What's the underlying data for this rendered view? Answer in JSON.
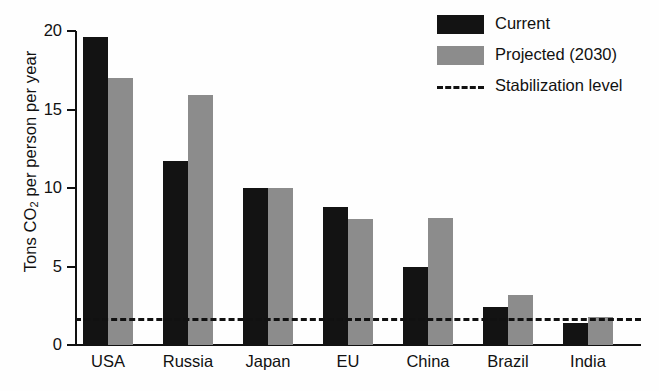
{
  "chart_data": {
    "type": "bar",
    "title": "",
    "xlabel": "",
    "ylabel": "Tons CO2 per person per year",
    "ylabel_prefix": "Tons CO",
    "ylabel_sub": "2",
    "ylabel_suffix": " per person per year",
    "categories": [
      "USA",
      "Russia",
      "Japan",
      "EU",
      "China",
      "Brazil",
      "India"
    ],
    "series": [
      {
        "name": "Current",
        "color": "#131313",
        "values": [
          19.6,
          11.7,
          10.0,
          8.8,
          5.0,
          2.4,
          1.4
        ]
      },
      {
        "name": "Projected (2030)",
        "color": "#8c8c8c",
        "values": [
          17.0,
          15.9,
          10.0,
          8.0,
          8.1,
          3.2,
          1.8
        ]
      }
    ],
    "reference_line": {
      "label": "Stabilization level",
      "value": 1.7,
      "style": "dashed",
      "color": "#111111"
    },
    "ylim": [
      0,
      20
    ],
    "yticks": [
      0,
      5,
      10,
      15,
      20
    ],
    "ytick_labels": [
      "0",
      "5",
      "10",
      "15",
      "20"
    ],
    "grid": false,
    "legend_position": "top-right",
    "legend": [
      "Current",
      "Projected (2030)",
      "Stabilization level"
    ]
  }
}
